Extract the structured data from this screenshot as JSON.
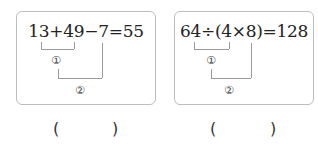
{
  "problems": [
    {
      "expression": "13+49−7=55",
      "steps": [
        "①",
        "②"
      ],
      "answer_open": "(",
      "answer_close": ")"
    },
    {
      "expression": "64÷(4×8)=128",
      "steps": [
        "①",
        "②"
      ],
      "answer_open": "(",
      "answer_close": ")"
    }
  ]
}
